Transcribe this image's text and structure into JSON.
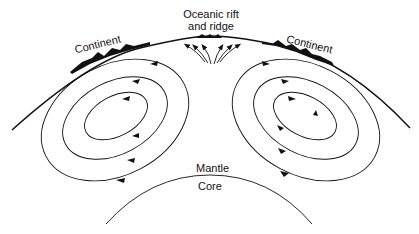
{
  "diagram": {
    "type": "mantle-convection",
    "labels": {
      "rift_line1": "Oceanic rift",
      "rift_line2": "and ridge",
      "continent_left": "Continent",
      "continent_right": "Continent",
      "mantle": "Mantle",
      "core": "Core"
    },
    "convection_cells": [
      {
        "side": "left",
        "loops": 3,
        "rotation": "counterclockwise"
      },
      {
        "side": "right",
        "loops": 3,
        "rotation": "clockwise"
      }
    ],
    "colors": {
      "line": "#111111",
      "background": "#ffffff"
    }
  }
}
